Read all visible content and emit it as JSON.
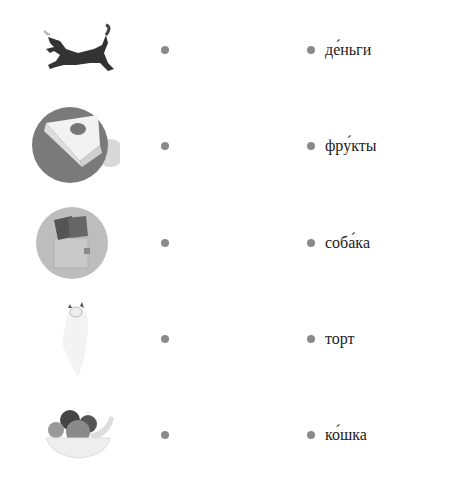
{
  "exercise": {
    "rows": [
      {
        "image": "dog-icon",
        "word": "де́ньги"
      },
      {
        "image": "cake-icon",
        "word": "фру́кты"
      },
      {
        "image": "money-wallet-icon",
        "word": "соба́ка"
      },
      {
        "image": "cat-icon",
        "word": "торт"
      },
      {
        "image": "fruit-bowl-icon",
        "word": "ко́шка"
      }
    ]
  },
  "colors": {
    "dot": "#8a8a8a",
    "text": "#222222"
  }
}
